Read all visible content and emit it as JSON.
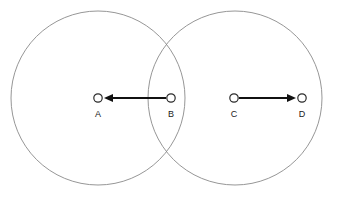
{
  "figure": {
    "type": "geometry-diagram",
    "background_color": "#ffffff",
    "width": 337,
    "height": 199
  },
  "colors": {
    "circle_stroke": "#8a8a8a",
    "arrow_stroke": "#111111",
    "marker_fill": "#ffffff",
    "marker_stroke": "#2b2b2b",
    "label_color": "#1a1a1a"
  },
  "circles": [
    {
      "name": "left-circle",
      "cx": 98,
      "cy": 98,
      "r": 87
    },
    {
      "name": "right-circle",
      "cx": 235,
      "cy": 98,
      "r": 87
    }
  ],
  "points": [
    {
      "id": "A",
      "label": "A",
      "cx": 98,
      "cy": 98,
      "r": 4.2,
      "label_x": 98,
      "label_y": 115
    },
    {
      "id": "B",
      "label": "B",
      "cx": 171,
      "cy": 98,
      "r": 4.2,
      "label_x": 171,
      "label_y": 115
    },
    {
      "id": "C",
      "label": "C",
      "cx": 234,
      "cy": 98,
      "r": 4.2,
      "label_x": 234,
      "label_y": 115
    },
    {
      "id": "D",
      "label": "D",
      "cx": 302,
      "cy": 98,
      "r": 4.2,
      "label_x": 302,
      "label_y": 115
    }
  ],
  "arrows": [
    {
      "name": "arrow-b-to-a",
      "from": "B",
      "to": "A",
      "direction": "left",
      "x1": 166,
      "y1": 98,
      "x2": 104,
      "y2": 98,
      "head_x": 104,
      "head_y": 98,
      "head_width": 9,
      "head_height": 8
    },
    {
      "name": "arrow-c-to-d",
      "from": "C",
      "to": "D",
      "direction": "right",
      "x1": 239,
      "y1": 98,
      "x2": 296,
      "y2": 98,
      "head_x": 296,
      "head_y": 98,
      "head_width": 9,
      "head_height": 8
    }
  ]
}
